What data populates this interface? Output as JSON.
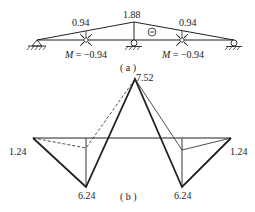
{
  "figure_a": {
    "caption": "( a )",
    "labels": {
      "left_peak": "0.94",
      "center_peak": "1.88",
      "right_peak": "0.94",
      "sign": "⊖",
      "left_moment_prefix": "M",
      "left_moment_value": " = −0.94",
      "right_moment_prefix": "M",
      "right_moment_value": " = −0.94"
    },
    "supports": [
      "pin-support",
      "roller-support",
      "roller-support"
    ],
    "joints": [
      "moment-hinge-left",
      "moment-hinge-right"
    ]
  },
  "figure_b": {
    "caption": "( b )",
    "labels": {
      "peak": "7.52",
      "left_end": "1.24",
      "right_end": "1.24",
      "left_bottom": "6.24",
      "right_bottom": "6.24"
    }
  },
  "colors": {
    "line": "#222222",
    "background": "#ffffff"
  }
}
